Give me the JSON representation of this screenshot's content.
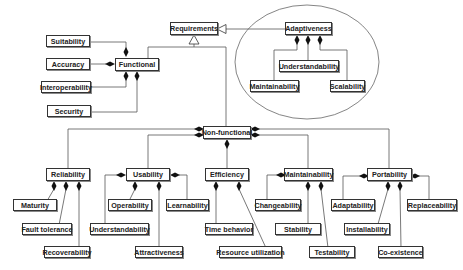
{
  "diagram": {
    "root": "Requirements",
    "adaptiveness_group": {
      "label": "Adaptiveness",
      "children": [
        "Understandability",
        "Maintainability",
        "Scalability"
      ]
    },
    "functional": {
      "label": "Functional",
      "children": [
        "Suitability",
        "Accuracy",
        "Interoperability",
        "Security"
      ]
    },
    "non_functional": {
      "label": "Non-functional",
      "categories": [
        {
          "label": "Reliability",
          "children": [
            "Maturity",
            "Fault tolerance",
            "Recoverability"
          ]
        },
        {
          "label": "Usability",
          "children": [
            "Operability",
            "Learnability",
            "Understandability",
            "Attractiveness"
          ]
        },
        {
          "label": "Efficiency",
          "children": [
            "Time behavior",
            "Resource utilization"
          ]
        },
        {
          "label": "Maintainability",
          "children": [
            "Changeability",
            "Stability",
            "Testability"
          ]
        },
        {
          "label": "Portability",
          "children": [
            "Adaptability",
            "Replaceability",
            "Installability",
            "Co-existence"
          ]
        }
      ]
    }
  }
}
